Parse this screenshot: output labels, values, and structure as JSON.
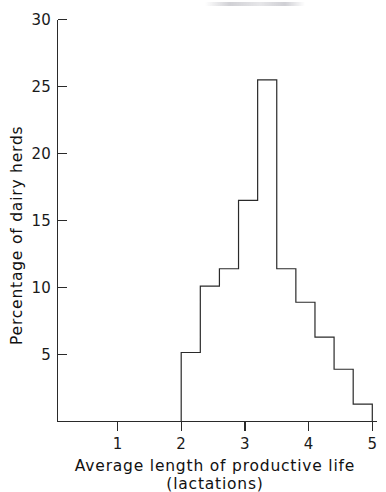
{
  "figure": {
    "background_color": "#ffffff",
    "ink_color": "#2a2a2a"
  },
  "chart_data": {
    "type": "bar",
    "title": "",
    "subtitle": "",
    "xlabel": "Average length of productive life (lactations)",
    "xlabel_line1": "Average length of productive life",
    "xlabel_line2": "(lactations)",
    "ylabel": "Percentage of dairy herds",
    "xlim": [
      0.5,
      5.05
    ],
    "ylim": [
      0,
      30
    ],
    "grid": false,
    "legend": false,
    "bin_width": 0.3,
    "bin_edges": [
      2.0,
      2.3,
      2.6,
      2.9,
      3.2,
      3.5,
      3.8,
      4.1,
      4.4,
      4.7,
      5.0
    ],
    "categories": [
      "2.0-2.3",
      "2.3-2.6",
      "2.6-2.9",
      "2.9-3.2",
      "3.2-3.5",
      "3.5-3.8",
      "3.8-4.1",
      "4.1-4.4",
      "4.4-4.7",
      "4.7-5.0"
    ],
    "bin_centers": [
      2.15,
      2.45,
      2.75,
      3.05,
      3.35,
      3.65,
      3.95,
      4.25,
      4.55,
      4.85
    ],
    "values": [
      5.15,
      10.1,
      11.4,
      16.5,
      25.5,
      11.4,
      8.9,
      6.3,
      3.9,
      1.3
    ],
    "x_ticks": [
      1,
      2,
      3,
      4,
      5
    ],
    "x_tick_labels": [
      "1",
      "2",
      "3",
      "4",
      "5"
    ],
    "y_ticks": [
      5,
      10,
      15,
      20,
      25,
      30
    ],
    "y_tick_labels": [
      "5",
      "10",
      "15",
      "20",
      "25",
      "30"
    ]
  },
  "axes": {
    "y_tick_labels": [
      "30",
      "25",
      "20",
      "15",
      "10",
      "5"
    ],
    "x_tick_labels": [
      "1",
      "2",
      "3",
      "4",
      "5"
    ],
    "y_axis_title": "Percentage of dairy herds",
    "x_axis_title_line1": "Average length of productive life",
    "x_axis_title_line2": "(lactations)"
  }
}
